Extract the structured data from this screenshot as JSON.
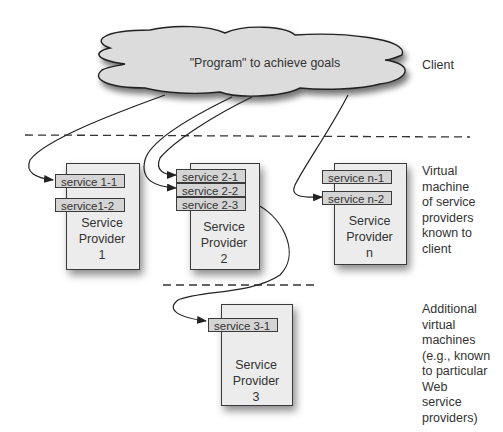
{
  "client_cloud": {
    "label": "\"Program\" to achieve goals"
  },
  "side_labels": {
    "client": "Client",
    "virtual_machine": [
      "Virtual",
      "machine",
      "of service",
      "providers",
      "known to",
      "client"
    ],
    "additional": [
      "Additional",
      "virtual",
      "machines",
      "(e.g., known",
      "to particular",
      "Web",
      "service",
      "providers)"
    ]
  },
  "providers": [
    {
      "name_lines": [
        "Service",
        "Provider",
        "1"
      ],
      "services": [
        "service 1-1",
        "service1-2"
      ]
    },
    {
      "name_lines": [
        "Service",
        "Provider",
        "2"
      ],
      "services": [
        "service 2-1",
        "service 2-2",
        "service 2-3"
      ]
    },
    {
      "name_lines": [
        "Service",
        "Provider",
        "n"
      ],
      "services": [
        "service n-1",
        "service n-2"
      ]
    },
    {
      "name_lines": [
        "Service",
        "Provider",
        "3"
      ],
      "services": [
        "service 3-1"
      ]
    }
  ]
}
